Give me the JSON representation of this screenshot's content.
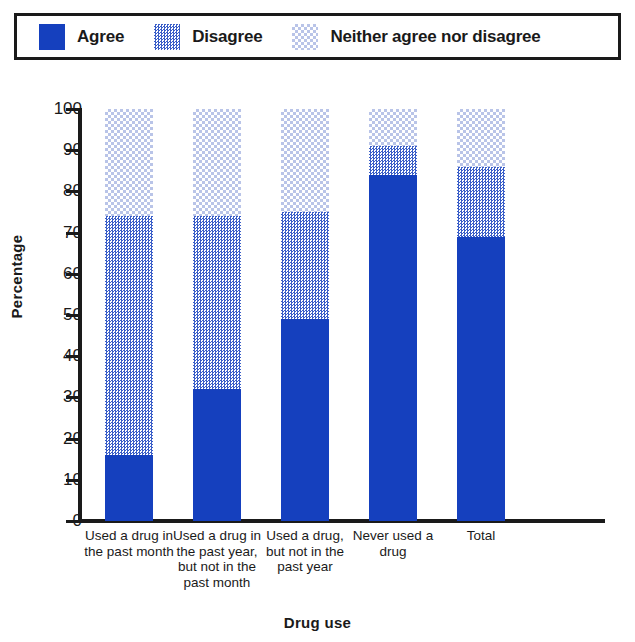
{
  "legend": {
    "items": [
      {
        "label": "Agree",
        "key": "agree",
        "color": "#1540be",
        "swatch": "solid-blue-swatch"
      },
      {
        "label": "Disagree",
        "key": "disagree",
        "color": "#5b6fc8",
        "swatch": "dithered-blue-swatch"
      },
      {
        "label": "Neither agree nor disagree",
        "key": "neither",
        "color": "#e4e8f5",
        "swatch": "light-dithered-swatch"
      }
    ]
  },
  "chart_data": {
    "type": "bar",
    "subtype": "stacked-bar",
    "title": "",
    "xlabel": "Drug use",
    "ylabel": "Percentage",
    "ylim": [
      0,
      100
    ],
    "yticks": [
      0,
      10,
      20,
      30,
      40,
      50,
      60,
      70,
      80,
      90,
      100
    ],
    "ytick_labels": [
      "0",
      "10",
      "20",
      "30",
      "40",
      "50",
      "60",
      "70",
      "80",
      "90",
      "100"
    ],
    "grid": false,
    "legend_position": "top",
    "categories": [
      "Used a drug in the past month",
      "Used a drug in the past year, but not in the past month",
      "Used a drug, but not in the past year",
      "Never used a drug",
      "Total"
    ],
    "category_label_lines": [
      [
        "Used a drug in",
        "the past month"
      ],
      [
        "Used a drug in",
        "the past year,",
        "but not in the",
        "past month"
      ],
      [
        "Used a drug,",
        "but not in the",
        "past year"
      ],
      [
        "Never used a",
        "drug"
      ],
      [
        "Total"
      ]
    ],
    "series": [
      {
        "name": "Agree",
        "color": "#1540be",
        "values": [
          16,
          32,
          49,
          84,
          69
        ]
      },
      {
        "name": "Disagree",
        "color": "#5b6fc8",
        "values": [
          58,
          42,
          26,
          7,
          17
        ]
      },
      {
        "name": "Neither agree nor disagree",
        "color": "#e4e8f5",
        "values": [
          26,
          26,
          25,
          9,
          14
        ]
      }
    ],
    "cumulative_tops": {
      "agree": [
        16,
        32,
        49,
        84,
        69
      ],
      "agree_plus_disagree": [
        74,
        74,
        75,
        91,
        86
      ],
      "total": [
        100,
        100,
        100,
        100,
        100
      ]
    }
  }
}
